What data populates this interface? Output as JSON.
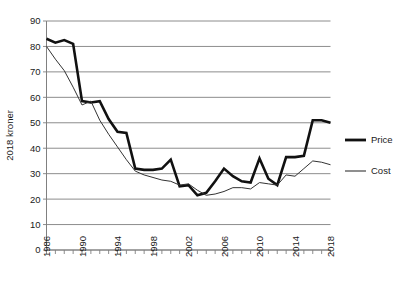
{
  "chart_data": {
    "type": "line",
    "title": "",
    "xlabel": "",
    "ylabel": "2018 kroner",
    "xlim": [
      1986,
      2018
    ],
    "ylim": [
      0,
      90
    ],
    "ytick_step": 10,
    "yticks": [
      0,
      10,
      20,
      30,
      40,
      50,
      60,
      70,
      80,
      90
    ],
    "ytick_labels": [
      "0",
      "10",
      "20",
      "30",
      "40",
      "50",
      "60",
      "70",
      "80",
      "90"
    ],
    "x": [
      1986,
      1987,
      1988,
      1989,
      1990,
      1991,
      1992,
      1993,
      1994,
      1995,
      1996,
      1997,
      1998,
      1999,
      2000,
      2001,
      2002,
      2003,
      2004,
      2005,
      2006,
      2007,
      2008,
      2009,
      2010,
      2011,
      2012,
      2013,
      2014,
      2015,
      2016,
      2017,
      2018
    ],
    "xticks": [
      1986,
      1987,
      1988,
      1989,
      1990,
      1991,
      1992,
      1993,
      1994,
      1995,
      1996,
      1997,
      1998,
      1999,
      2000,
      2001,
      2002,
      2003,
      2004,
      2005,
      2006,
      2007,
      2008,
      2009,
      2010,
      2011,
      2012,
      2013,
      2014,
      2015,
      2016,
      2017,
      2018
    ],
    "xtick_labels_shown": [
      "1986",
      "1990",
      "1994",
      "1998",
      "2002",
      "2006",
      "2010",
      "2014",
      "2018"
    ],
    "xtick_label_step": 4,
    "grid": "horizontal",
    "legend_position": "right",
    "series": [
      {
        "name": "Price",
        "style": "thick",
        "color": "#111111",
        "values": [
          83.0,
          81.5,
          82.5,
          81.0,
          58.5,
          58.0,
          58.5,
          51.5,
          46.5,
          46.0,
          32.0,
          31.5,
          31.5,
          32.0,
          35.5,
          25.0,
          25.5,
          21.5,
          22.5,
          27.0,
          32.0,
          29.0,
          27.0,
          26.5,
          36.0,
          28.0,
          25.5,
          36.5,
          36.5,
          37.0,
          51.0,
          51.0,
          50.0
        ]
      },
      {
        "name": "Cost",
        "style": "thin",
        "color": "#333333",
        "values": [
          80.0,
          75.0,
          70.5,
          64.0,
          57.0,
          58.5,
          51.0,
          45.5,
          40.5,
          35.5,
          31.0,
          29.5,
          28.5,
          27.5,
          27.0,
          25.5,
          26.0,
          23.5,
          21.5,
          22.0,
          23.0,
          24.5,
          24.5,
          24.0,
          26.5,
          26.0,
          25.5,
          29.5,
          29.0,
          32.0,
          35.0,
          34.5,
          33.5
        ]
      }
    ]
  },
  "legend": {
    "items": [
      {
        "label": "Price"
      },
      {
        "label": "Cost"
      }
    ]
  }
}
